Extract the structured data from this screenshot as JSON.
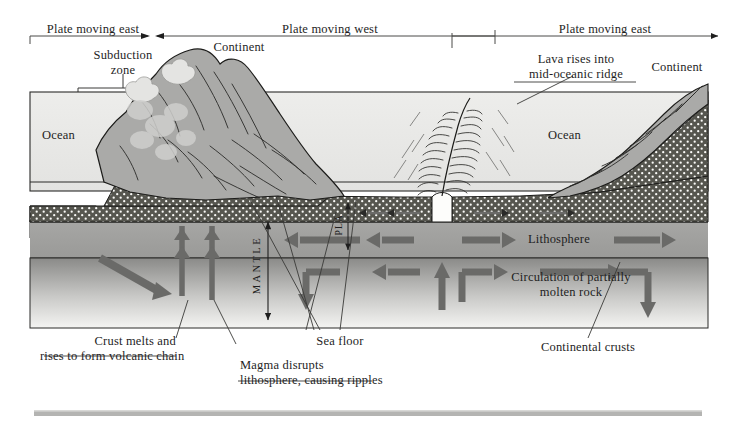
{
  "diagram": {
    "header": {
      "segments": [
        {
          "label": "Plate moving east",
          "direction": "left-arrow"
        },
        {
          "label": "Plate moving west",
          "direction": "none"
        },
        {
          "label": "Plate moving east",
          "direction": "right-arrow"
        }
      ]
    },
    "labels": {
      "subduction_zone": "Subduction\nzone",
      "continent_left": "Continent",
      "continent_right": "Continent",
      "ocean_left": "Ocean",
      "ocean_right": "Ocean",
      "lava_ridge": "Lava rises into\nmid-oceanic ridge",
      "lithosphere": "Lithosphere",
      "mantle": "MANTLE",
      "plate": "PLA",
      "circulation": "Circulation of partially\nmolten rock",
      "crust_melts": "Crust melts and\nrises to form volcanic chain",
      "sea_floor": "Sea floor",
      "magma_disrupts": "Magma disrupts\nlithosphere, causing ripples",
      "continental_crusts": "Continental crusts"
    },
    "colors": {
      "ink": "#1e1e1e",
      "ocean": "#e9e9e7",
      "continent_rock": "#a8a8a6",
      "oceanic_crust": "#5a5a58",
      "lithosphere_band": "#9e9e9c",
      "asthenosphere_top": "#8d8d8b",
      "asthenosphere_bottom": "#f2f2f0",
      "arrow": "#6a6a68",
      "rule": "#b8b8b6",
      "footer_bar": "#b4b4b2"
    }
  }
}
